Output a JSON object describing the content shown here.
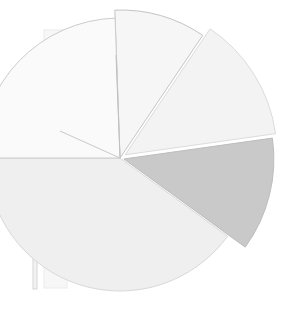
{
  "figure": {
    "background_color": "#ffffff",
    "width": 298,
    "height": 317,
    "title": "",
    "subtitle": ""
  },
  "chart_data": {
    "type": "pie",
    "title": "",
    "subtitle": "",
    "xlabel": "",
    "ylabel": "",
    "legend": "none",
    "grid": false,
    "note": "Heavily faded / low-contrast exploded pie chart. Wedges radiate from a common center; several wedges are nearly white against the white page.",
    "center": {
      "x": 120,
      "y": 158
    },
    "radius": 150,
    "start_angle_deg": 270,
    "direction": "clockwise",
    "labels": [
      "Wedge A",
      "Wedge B",
      "Wedge C",
      "Wedge D",
      "Wedge E"
    ],
    "values": [
      12,
      24,
      17,
      37,
      10
    ],
    "percentages": [
      12,
      24,
      17,
      37,
      10
    ],
    "colors": [
      "#f5f5f5",
      "#f2f2f2",
      "#c9c9c9",
      "#eeeeee",
      "#f7f7f7"
    ],
    "edge_color": "#b9b9b9",
    "series": [
      {
        "name": "slices",
        "values": [
          12,
          24,
          17,
          37,
          10
        ]
      }
    ]
  },
  "wedges": [
    {
      "name": "wedge-upper-narrow",
      "label": "Wedge A",
      "value": 12,
      "start_deg": 268,
      "end_deg": 304,
      "radius": 148,
      "offset": 0,
      "fill": "#f6f6f6",
      "stroke": "#c4c4c4"
    },
    {
      "name": "wedge-upper-right",
      "label": "Wedge B",
      "value": 24,
      "start_deg": 304,
      "end_deg": 352,
      "radius": 152,
      "offset": 6,
      "fill": "#f3f3f3",
      "stroke": "#dcdcdc"
    },
    {
      "name": "wedge-right-gray",
      "label": "Wedge C",
      "value": 17,
      "start_deg": 352,
      "end_deg": 36,
      "radius": 150,
      "offset": 4,
      "fill": "#c9c9c9",
      "stroke": "#bdbdbd"
    },
    {
      "name": "wedge-bottom",
      "label": "Wedge D",
      "value": 37,
      "start_deg": 36,
      "end_deg": 180,
      "radius": 133,
      "offset": 0,
      "fill": "#efefef",
      "stroke": "#d8d8d8"
    },
    {
      "name": "wedge-left-upper",
      "label": "Wedge E",
      "value": 10,
      "start_deg": 180,
      "end_deg": 268,
      "radius": 140,
      "offset": 0,
      "fill": "#fafafa",
      "stroke": "#cccccc"
    }
  ],
  "bars": [
    {
      "name": "bar-thin-left",
      "x": 33,
      "y": 88,
      "width": 4,
      "height": 201,
      "fill": "#f2f2f2",
      "stroke": "#d6d6d6"
    },
    {
      "name": "bar-wide-left",
      "x": 44,
      "y": 30,
      "width": 23,
      "height": 258,
      "fill": "#f7f7f7",
      "stroke": "#ececec"
    }
  ],
  "radial_lines": [
    {
      "name": "radial-line-up",
      "x1": 120,
      "y1": 158,
      "x2": 116,
      "y2": 55,
      "stroke": "#c0c0c0"
    },
    {
      "name": "radial-line-upleft",
      "x1": 120,
      "y1": 158,
      "x2": 60,
      "y2": 131,
      "stroke": "#c9c9c9"
    }
  ]
}
